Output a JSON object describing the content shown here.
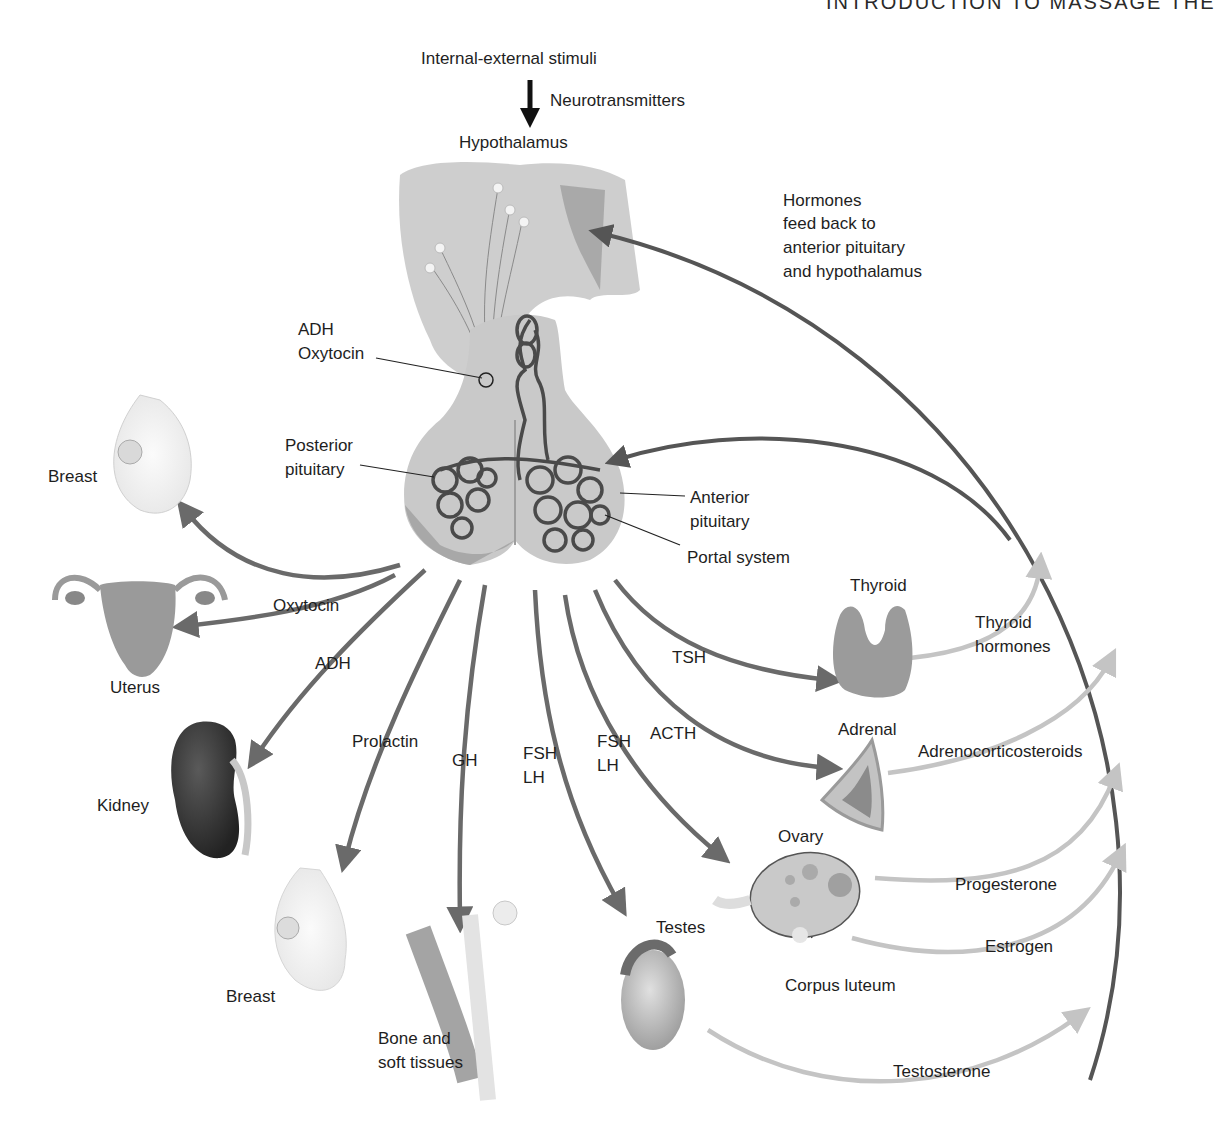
{
  "header": {
    "running_title": "INTRODUCTION TO MASSAGE THE"
  },
  "colors": {
    "dark_arrow": "#6a6a6a",
    "light_arrow": "#c4c4c4",
    "feedback_arrow": "#555555",
    "tissue_gray": "#bdbdbd",
    "vessel": "#4a4a4a"
  },
  "diagram": {
    "top": {
      "stimuli": "Internal-external stimuli",
      "neurotransmitters": "Neurotransmitters",
      "hypothalamus": "Hypothalamus"
    },
    "feedback": {
      "line1": "Hormones",
      "line2": "feed back to",
      "line3": "anterior pituitary",
      "line4": "and hypothalamus"
    },
    "pituitary": {
      "adh": "ADH",
      "oxytocin": "Oxytocin",
      "posterior_line1": "Posterior",
      "posterior_line2": "pituitary",
      "anterior_line1": "Anterior",
      "anterior_line2": "pituitary",
      "portal_system": "Portal system"
    },
    "hormones": {
      "oxytocin": "Oxytocin",
      "adh": "ADH",
      "prolactin": "Prolactin",
      "gh": "GH",
      "fsh1": "FSH",
      "lh1": "LH",
      "fsh2": "FSH",
      "lh2": "LH",
      "acth": "ACTH",
      "tsh": "TSH"
    },
    "targets": {
      "breast_top": "Breast",
      "uterus": "Uterus",
      "kidney": "Kidney",
      "breast_bottom": "Breast",
      "bone_line1": "Bone and",
      "bone_line2": "soft tissues",
      "testes": "Testes",
      "ovary": "Ovary",
      "corpus_luteum": "Corpus luteum",
      "thyroid": "Thyroid",
      "adrenal": "Adrenal"
    },
    "secreted": {
      "thyroid_line1": "Thyroid",
      "thyroid_line2": "hormones",
      "adrenocorticosteroids": "Adrenocorticosteroids",
      "progesterone": "Progesterone",
      "estrogen": "Estrogen",
      "testosterone": "Testosterone"
    }
  }
}
